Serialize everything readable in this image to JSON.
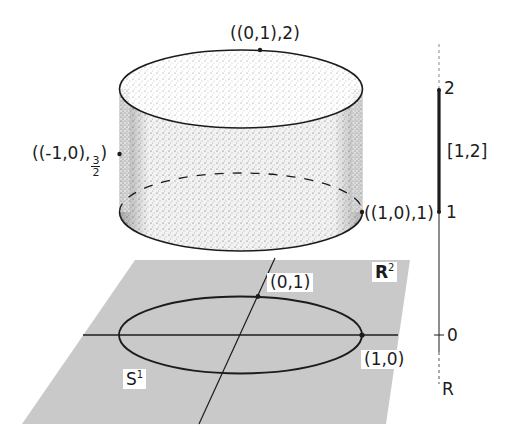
{
  "diagram": {
    "colors": {
      "ink": "#1c1c1c",
      "plane_fill": "#c9c9c9",
      "stipple": "#5a5a5a",
      "background": "#ffffff"
    },
    "cylinder": {
      "labels": {
        "top_point": "((0,1),2)",
        "left_point_prefix": "((-1,0),",
        "left_point_frac_num": "3",
        "left_point_frac_den": "2",
        "left_point_suffix": ")",
        "right_point": "((1,0),1)"
      }
    },
    "plane": {
      "name_base": "R",
      "name_exp": "2",
      "circle_label_base": "S",
      "circle_label_exp": "1",
      "point_top": "(0,1)",
      "point_right": "(1,0)"
    },
    "real_line": {
      "tick_2": "2",
      "tick_1": "1",
      "tick_0": "0",
      "interval": "[1,2]",
      "axis_name": "R"
    }
  }
}
